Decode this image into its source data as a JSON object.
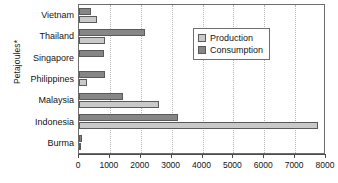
{
  "chart_data": {
    "type": "bar",
    "orientation": "horizontal",
    "title": "",
    "xlabel": "",
    "ylabel": "Petajoules*",
    "xlim": [
      0,
      8000
    ],
    "xticks": [
      0,
      1000,
      2000,
      3000,
      4000,
      5000,
      6000,
      7000,
      8000
    ],
    "xtick_labels": [
      "0",
      "1000",
      "2000",
      "3000",
      "4000",
      "5000",
      "6000",
      "7000",
      "8000"
    ],
    "grid": "vertical-dotted",
    "legend_position": "upper-right-inside",
    "categories": [
      "Vietnam",
      "Thailand",
      "Singapore",
      "Philippines",
      "Malaysia",
      "Indonesia",
      "Burma"
    ],
    "series": [
      {
        "name": "Production",
        "color": "#c9c9c9",
        "values": [
          580,
          840,
          0,
          250,
          2600,
          7750,
          50
        ]
      },
      {
        "name": "Consumption",
        "color": "#868686",
        "values": [
          380,
          2150,
          820,
          830,
          1430,
          3200,
          100
        ]
      }
    ]
  },
  "legend": {
    "items": [
      {
        "label": "Production",
        "swatch": "production"
      },
      {
        "label": "Consumption",
        "swatch": "consumption"
      }
    ]
  }
}
